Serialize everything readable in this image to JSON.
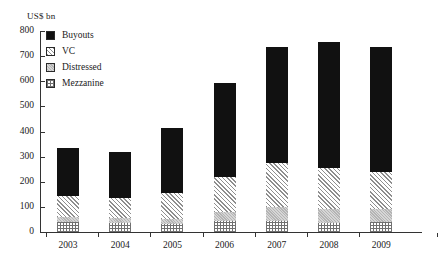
{
  "chart_data": {
    "type": "bar",
    "subtype": "stacked-bar",
    "title": "",
    "subtitle": "",
    "xlabel": "",
    "ylabel": "US$ bn",
    "unit_label": "US$ bn",
    "categories": [
      "2003",
      "2004",
      "2005",
      "2006",
      "2007",
      "2008",
      "2009"
    ],
    "ylim": [
      0,
      800
    ],
    "yticks": [
      0,
      100,
      200,
      300,
      400,
      500,
      600,
      700,
      800
    ],
    "ytick_labels": [
      "0",
      "100",
      "200",
      "300",
      "400",
      "500",
      "600",
      "700",
      "800"
    ],
    "grid": false,
    "legend_position": "top-left",
    "series": [
      {
        "name": "Buyouts",
        "pattern": "solid-black",
        "color": "#111111",
        "values": [
          190,
          185,
          260,
          375,
          460,
          500,
          495
        ]
      },
      {
        "name": "VC",
        "pattern": "diagonal-hatch",
        "color": "#8e8e8e",
        "values": [
          85,
          80,
          105,
          140,
          175,
          165,
          150
        ]
      },
      {
        "name": "Distressed",
        "pattern": "gray-fill",
        "color": "#b4b4b4",
        "values": [
          20,
          20,
          20,
          35,
          55,
          55,
          50
        ]
      },
      {
        "name": "Mezzanine",
        "pattern": "crosshatch",
        "color": "#707070",
        "values": [
          40,
          35,
          30,
          45,
          45,
          35,
          40
        ]
      }
    ],
    "totals": [
      335,
      320,
      415,
      595,
      735,
      755,
      735
    ]
  },
  "legend": {
    "items": [
      {
        "label": "Buyouts"
      },
      {
        "label": "VC"
      },
      {
        "label": "Distressed"
      },
      {
        "label": "Mezzanine"
      }
    ]
  }
}
